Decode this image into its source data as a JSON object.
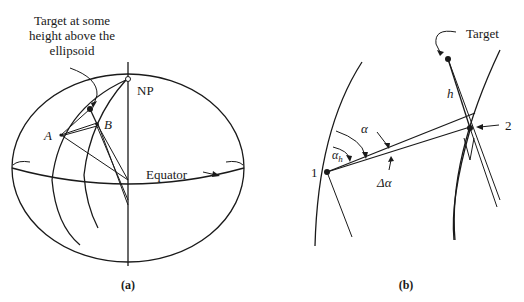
{
  "figure": {
    "panel_a": {
      "caption": "(a)",
      "target_label_lines": [
        "Target at some",
        "height above the",
        "ellipsoid"
      ],
      "point_a": "A",
      "point_b": "B",
      "north_pole": "NP",
      "equator": "Equator"
    },
    "panel_b": {
      "caption": "(b)",
      "target": "Target",
      "height": "h",
      "station_1": "1",
      "station_2": "2",
      "alpha": "α",
      "alpha_h": "α",
      "alpha_h_sub": "h",
      "delta_alpha": "Δα"
    }
  }
}
